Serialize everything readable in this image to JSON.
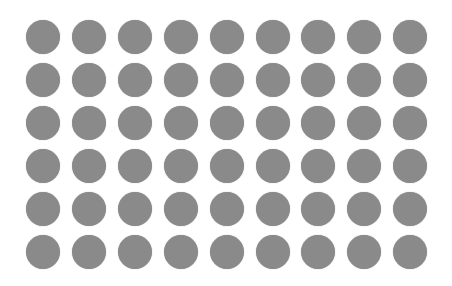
{
  "grid": {
    "rows": 6,
    "cols": 9,
    "start_x": 43,
    "start_y": 37,
    "step_x": 45.9,
    "step_y": 43,
    "diameter": 34,
    "dot_color": "#8a8a8a",
    "background": "#ffffff"
  }
}
